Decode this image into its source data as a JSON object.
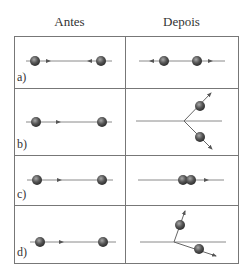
{
  "headers": {
    "before": "Antes",
    "after": "Depois"
  },
  "colors": {
    "line": "#8a8a8a",
    "border": "#777777",
    "ball_dark": "#3a3a3a",
    "ball_light": "#9a9a9a",
    "arrow": "#555555"
  },
  "rows": [
    {
      "label": "a)",
      "description": "Two balls approaching each other head-on; after collision both move apart along the same line."
    },
    {
      "label": "b)",
      "description": "Left ball moves right toward stationary right ball; after collision both balls scatter at symmetric angles (up-right and down-right)."
    },
    {
      "label": "c)",
      "description": "Left ball moves right toward stationary ball; after collision both balls stick together and move right."
    },
    {
      "label": "d)",
      "description": "Left ball moves right toward stationary ball; after collision balls scatter at asymmetric angles (one steeply up, one shallow down-right)."
    }
  ]
}
